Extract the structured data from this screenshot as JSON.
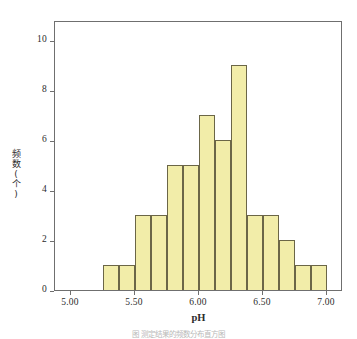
{
  "chart_data": {
    "type": "bar",
    "title": "",
    "subtitle": "",
    "xlabel": "pH",
    "ylabel": "频数(个)",
    "grid": false,
    "legend": false,
    "legend_position": "none",
    "bin_width": 0.125,
    "bin_edges": [
      5.25,
      5.375,
      5.5,
      5.625,
      5.75,
      5.875,
      6.0,
      6.125,
      6.25,
      6.375,
      6.5,
      6.625,
      6.75,
      6.875,
      7.0
    ],
    "categories": [
      "5.250–5.375",
      "5.375–5.500",
      "5.500–5.625",
      "5.625–5.750",
      "5.750–5.875",
      "5.875–6.000",
      "6.000–6.125",
      "6.125–6.250",
      "6.250–6.375",
      "6.375–6.500",
      "6.500–6.625",
      "6.625–6.750",
      "6.750–6.875",
      "6.875–7.000"
    ],
    "values": [
      1,
      1,
      3,
      3,
      5,
      5,
      7,
      6,
      9,
      3,
      3,
      2,
      1,
      1
    ],
    "total_count": 50,
    "xlim": [
      4.875,
      7.125
    ],
    "ylim": [
      0,
      10.8
    ],
    "xticks": [
      5.0,
      5.5,
      6.0,
      6.5,
      7.0
    ],
    "xtick_labels": [
      "5.00",
      "5.50",
      "6.00",
      "6.50",
      "7.00"
    ],
    "yticks": [
      0,
      2,
      4,
      6,
      8,
      10
    ],
    "ytick_labels": [
      "0",
      "2",
      "4",
      "6",
      "8",
      "10"
    ],
    "bar_fill_color": "#f2eda9",
    "bar_edge_color": "#6b6647",
    "frame_color": "#6f6f6f",
    "background_color": "#ffffff"
  },
  "axis": {
    "x_title": "pH",
    "y_title_chars": [
      "频",
      "数",
      "(",
      "个",
      ")"
    ]
  },
  "caption": {
    "text": "图      测定结果的频数分布直方图"
  }
}
